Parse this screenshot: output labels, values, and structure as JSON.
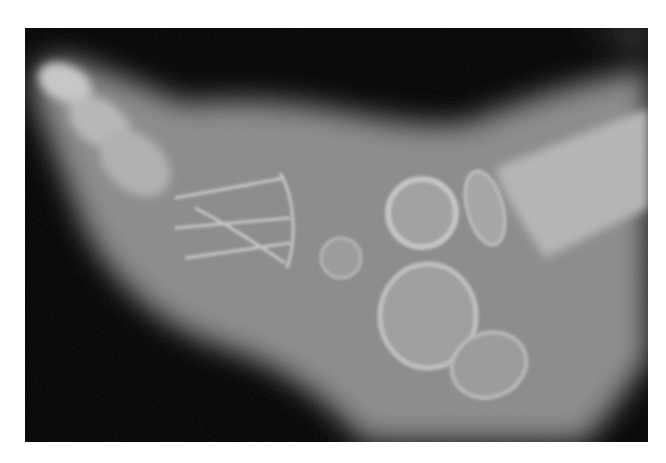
{
  "image": {
    "subject": "lateral radiograph of infant foot",
    "modality": "X-ray",
    "background_color": "#ffffff",
    "field_color": "#000000",
    "frame": {
      "x": 25,
      "y": 28,
      "width": 623,
      "height": 414
    }
  }
}
